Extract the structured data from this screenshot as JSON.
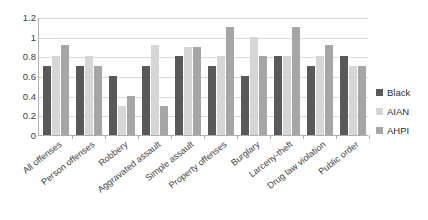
{
  "chart_data": {
    "type": "bar",
    "title": "",
    "subtitle": "",
    "xlabel": "",
    "ylabel": "",
    "ylim": [
      0,
      1.2
    ],
    "ytick_values": [
      0,
      0.2,
      0.4,
      0.6,
      0.8,
      1,
      1.2
    ],
    "ytick_labels": [
      "0",
      "0.2",
      "0.4",
      "0.6",
      "0.8",
      "1",
      "1.2"
    ],
    "grid": true,
    "legend_position": "right",
    "categories": [
      "All offenses",
      "Person offenses",
      "Robbery",
      "Aggravated assault",
      "Simple assault",
      "Property offenses",
      "Burglary",
      "Larceny-theft",
      "Drug law violation",
      "Public order"
    ],
    "series": [
      {
        "name": "Black",
        "color": "#595959",
        "values": [
          0.7,
          0.7,
          0.6,
          0.7,
          0.8,
          0.7,
          0.6,
          0.8,
          0.7,
          0.8
        ]
      },
      {
        "name": "AIAN",
        "color": "#d6d6d6",
        "values": [
          0.8,
          0.8,
          0.3,
          0.92,
          0.9,
          0.8,
          1.0,
          0.8,
          0.8,
          0.7
        ]
      },
      {
        "name": "AHPI",
        "color": "#a6a6a6",
        "values": [
          0.92,
          0.7,
          0.4,
          0.3,
          0.9,
          1.1,
          0.8,
          1.1,
          0.92,
          0.7
        ]
      }
    ]
  },
  "legend": {
    "items": [
      {
        "label": "Black"
      },
      {
        "label": "AIAN"
      },
      {
        "label": "AHPI"
      }
    ]
  }
}
